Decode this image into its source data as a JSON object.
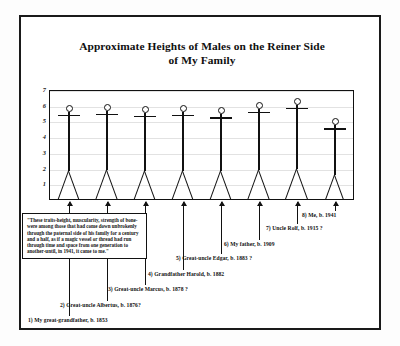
{
  "document": {
    "title_line1": "Approximate Heights of Males on the Reiner Side",
    "title_line2": "of My Family"
  },
  "quote": {
    "text": "\"These traits-height, muscularity, strength of bone-were among those that had come down unbrokenly through the paternal side of his family for a century and a half, as if a magic vessel or thread had run through time and space from one generation to another-until, in 1941, it came to me.\""
  },
  "chart_data": {
    "type": "bar",
    "title": "Approximate Heights of Males on the Reiner Side of My Family",
    "xlabel": "",
    "ylabel": "",
    "ylim": [
      0,
      7
    ],
    "grid": true,
    "legend": "none",
    "yticks": [
      "7",
      "6",
      "5",
      "4",
      "3",
      "2",
      "1"
    ],
    "categories": [
      "1) My great-grandfather, b. 1853",
      "2) Great-uncle Albertus, b. 1876?",
      "3) Great-uncle Marcus, b. 1878 ?",
      "4) Grandfather Harold, b. 1882",
      "5) Great-uncle Edgar, b. 1883 ?",
      "6) My father, b. 1909",
      "7) Uncle Rolf, b. 1915 ?",
      "8) Me, b. 1941"
    ],
    "values": [
      6.0,
      6.05,
      5.95,
      6.0,
      5.85,
      6.2,
      6.45,
      5.15
    ]
  },
  "callouts": [
    {
      "id": "1",
      "label": "1) My great-grandfather, b. 1853"
    },
    {
      "id": "2",
      "label": "2) Great-uncle Albertus, b. 1876?"
    },
    {
      "id": "3",
      "label": "3) Great-uncle Marcus, b. 1878 ?"
    },
    {
      "id": "4",
      "label": "4) Grandfather Harold, b. 1882"
    },
    {
      "id": "5",
      "label": "5) Great-uncle Edgar, b. 1883 ?"
    },
    {
      "id": "6",
      "label": "6) My father, b. 1909"
    },
    {
      "id": "7",
      "label": "7) Uncle Rolf, b. 1915 ?"
    },
    {
      "id": "8",
      "label": "8) Me, b. 1941"
    }
  ]
}
